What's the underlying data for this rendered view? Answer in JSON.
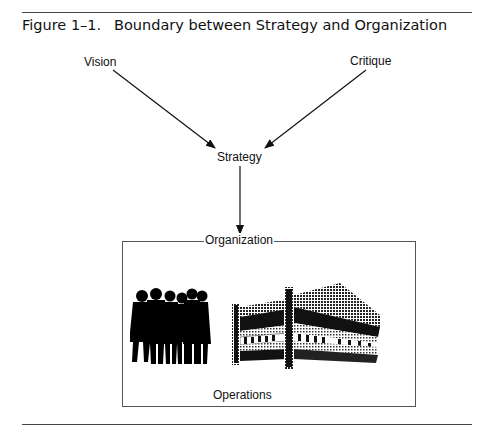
{
  "figure": {
    "number": "Figure 1–1.",
    "title": "Boundary between Strategy and Organization"
  },
  "nodes": {
    "vision": "Vision",
    "critique": "Critique",
    "strategy": "Strategy",
    "organization": "Organization",
    "operations": "Operations"
  },
  "edges": [
    {
      "from": "Vision",
      "to": "Strategy"
    },
    {
      "from": "Critique",
      "to": "Strategy"
    },
    {
      "from": "Strategy",
      "to": "Organization"
    }
  ],
  "illustrations": {
    "people": "group-of-people-silhouette",
    "building": "office-building"
  }
}
